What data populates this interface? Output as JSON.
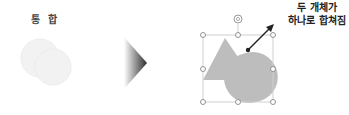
{
  "title": "통 합",
  "callout": {
    "line1": "두 개체가",
    "line2": "하나로 합쳐짐"
  },
  "colors": {
    "before_shapes": "#f0f0f0",
    "merged_shape": "#bdbdbd",
    "selection_frame": "#c8c8c8",
    "arrow": "#222222",
    "transition_arrow": "#333333"
  },
  "icons": {
    "rotate_handle": "rotate-icon",
    "transition": "right-chevron-arrow"
  }
}
